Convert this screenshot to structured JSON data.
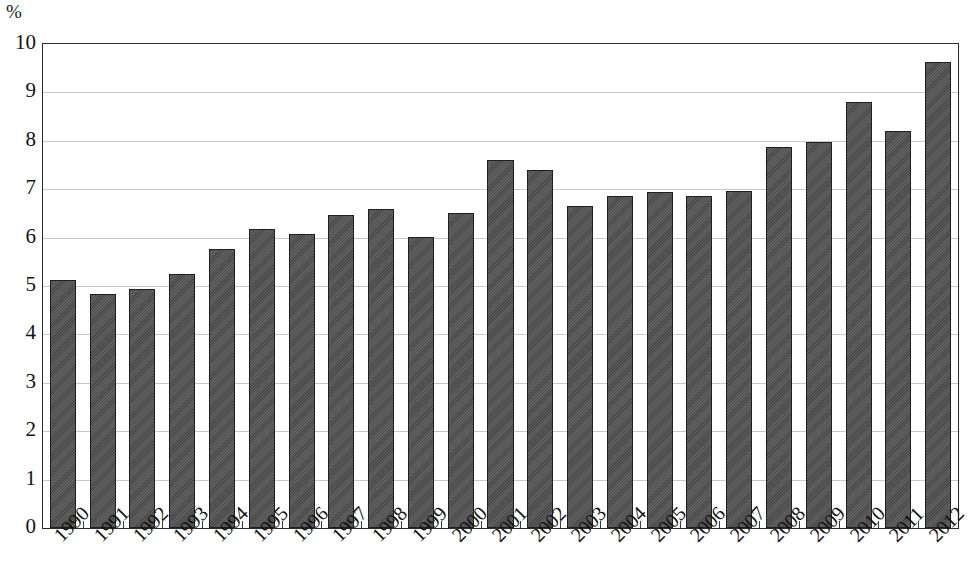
{
  "chart_data": {
    "type": "bar",
    "title": "",
    "subtitle": "",
    "xlabel": "",
    "ylabel": "%",
    "unit_label": "%",
    "ylim": [
      0,
      10
    ],
    "ytick_step": 1,
    "ytick_labels": [
      "10",
      "9",
      "8",
      "7",
      "6",
      "5",
      "4",
      "3",
      "2",
      "1",
      "0"
    ],
    "grid": true,
    "grid_axis": "y",
    "legend": false,
    "legend_position": "none",
    "bar_color": "#4f4f4f",
    "bar_edge_color": "#1f1f1f",
    "grid_color": "#c9c9c9",
    "axis_color": "#2b2b2b",
    "background_color": "#ffffff",
    "categories": [
      "1990",
      "1991",
      "1992",
      "1993",
      "1994",
      "1995",
      "1996",
      "1997",
      "1998",
      "1999",
      "2000",
      "2001",
      "2002",
      "2003",
      "2004",
      "2005",
      "2006",
      "2007",
      "2008",
      "2009",
      "2010",
      "2011",
      "2012"
    ],
    "values": [
      5.12,
      4.83,
      4.93,
      5.25,
      5.77,
      6.17,
      6.07,
      6.47,
      6.6,
      6.02,
      6.5,
      7.6,
      7.4,
      6.65,
      6.85,
      6.95,
      6.85,
      6.97,
      7.88,
      7.98,
      8.8,
      8.2,
      9.62
    ],
    "series": [
      {
        "name": "",
        "values": [
          5.12,
          4.83,
          4.93,
          5.25,
          5.77,
          6.17,
          6.07,
          6.47,
          6.6,
          6.02,
          6.5,
          7.6,
          7.4,
          6.65,
          6.85,
          6.95,
          6.85,
          6.97,
          7.88,
          7.98,
          8.8,
          8.2,
          9.62
        ]
      }
    ]
  }
}
